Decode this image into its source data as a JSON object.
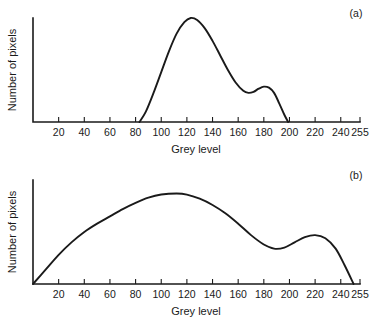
{
  "figure": {
    "background_color": "#ffffff",
    "ink_color": "#1a1a1a"
  },
  "chart_data": [
    {
      "type": "line",
      "panel_label": "(a)",
      "title": "",
      "xlabel": "Grey level",
      "ylabel": "Number of pixels",
      "xlim": [
        0,
        255
      ],
      "ylim": [
        0,
        100
      ],
      "grid": false,
      "legend": "none",
      "xticks": [
        20,
        40,
        60,
        80,
        100,
        120,
        140,
        160,
        180,
        200,
        220,
        240,
        255
      ],
      "xticklabels": [
        "20",
        "40",
        "60",
        "80",
        "100",
        "120",
        "140",
        "160",
        "180",
        "200",
        "220",
        "240",
        "255"
      ],
      "yticks": [],
      "yticklabels": [],
      "series": [
        {
          "name": "bimodal histogram",
          "x": [
            83,
            88,
            94,
            100,
            106,
            112,
            118,
            123,
            128,
            134,
            140,
            146,
            152,
            158,
            164,
            168,
            172,
            176,
            180,
            184,
            188,
            192,
            196,
            199
          ],
          "y": [
            0,
            10,
            28,
            48,
            68,
            85,
            96,
            100,
            98,
            90,
            78,
            64,
            50,
            38,
            30,
            28,
            29,
            32,
            34,
            33,
            28,
            18,
            7,
            0
          ]
        }
      ]
    },
    {
      "type": "line",
      "panel_label": "(b)",
      "title": "",
      "xlabel": "Grey level",
      "ylabel": "Number of pixels",
      "xlim": [
        0,
        255
      ],
      "ylim": [
        0,
        100
      ],
      "grid": false,
      "legend": "none",
      "xticks": [
        20,
        40,
        60,
        80,
        100,
        120,
        140,
        160,
        180,
        200,
        220,
        240,
        255
      ],
      "xticklabels": [
        "20",
        "40",
        "60",
        "80",
        "100",
        "120",
        "140",
        "160",
        "180",
        "200",
        "220",
        "240",
        "255"
      ],
      "yticks": [],
      "yticklabels": [],
      "series": [
        {
          "name": "stretched histogram",
          "x": [
            0,
            10,
            20,
            30,
            40,
            50,
            60,
            70,
            80,
            90,
            100,
            112,
            120,
            130,
            140,
            150,
            160,
            170,
            180,
            188,
            196,
            204,
            212,
            220,
            228,
            236,
            243,
            250
          ],
          "y": [
            0,
            14,
            28,
            40,
            50,
            58,
            65,
            72,
            78,
            83,
            86,
            87,
            86,
            82,
            76,
            68,
            58,
            47,
            38,
            34,
            35,
            40,
            45,
            47,
            44,
            34,
            18,
            0
          ]
        }
      ]
    }
  ],
  "panels": [
    {
      "id": "panel-a",
      "label": "(a)",
      "x_axis_title": "Grey level",
      "y_axis_title": "Number of pixels"
    },
    {
      "id": "panel-b",
      "label": "(b)",
      "x_axis_title": "Grey level",
      "y_axis_title": "Number of pixels"
    }
  ]
}
